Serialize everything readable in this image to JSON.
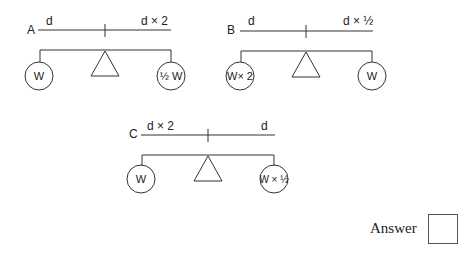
{
  "diagrams": [
    {
      "id": "A",
      "label": "A",
      "left_distance": "d",
      "right_distance": "d × 2",
      "left_weight": "W",
      "right_weight": "½ W"
    },
    {
      "id": "B",
      "label": "B",
      "left_distance": "d",
      "right_distance": "d × ½",
      "left_weight": "W× 2",
      "right_weight": "W"
    },
    {
      "id": "C",
      "label": "C",
      "left_distance": "d × 2",
      "right_distance": "d",
      "left_weight": "W",
      "right_weight": "W × ½"
    }
  ],
  "answer": {
    "label": "Answer",
    "value": ""
  }
}
